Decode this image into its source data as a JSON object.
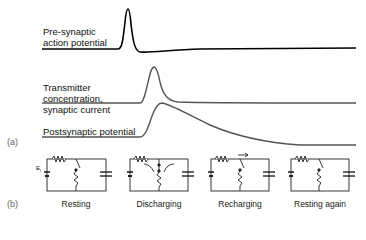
{
  "figure": {
    "panel_a": {
      "tag": "(a)",
      "traces": [
        {
          "label_line1": "Pre-synaptic",
          "label_line2": "action potential",
          "color": "#000000"
        },
        {
          "label_line1": "Transmitter",
          "label_line2": "concentration,",
          "label_line3": "synaptic current",
          "color": "#444444"
        },
        {
          "label_line1": "Postsynaptic potential",
          "color": "#444444"
        }
      ]
    },
    "panel_b": {
      "tag": "(b)",
      "circuits": [
        {
          "caption": "Resting",
          "battery_label": "E",
          "battery_sub": "l"
        },
        {
          "caption": "Discharging"
        },
        {
          "caption": "Recharging"
        },
        {
          "caption": "Resting again"
        }
      ]
    }
  }
}
